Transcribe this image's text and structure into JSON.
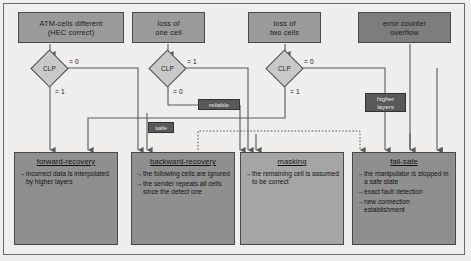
{
  "diagram": {
    "title_hidden": "",
    "colors": {
      "box_fill": "#9a9a9a",
      "box_fill_dark": "#7d7d7d",
      "box_fill_light": "#a5a5a5",
      "diamond_fill": "#c9c9c9",
      "tag_fill": "#595959",
      "line": "#5a5a5a",
      "background": "#efeeec"
    },
    "top_nodes": [
      {
        "id": "atm-cells-different",
        "lines": [
          "ATM-cells different",
          "(HEC correct)"
        ]
      },
      {
        "id": "loss-of-one-cell",
        "lines": [
          "loss of",
          "one cell"
        ]
      },
      {
        "id": "loss-of-two-cells",
        "lines": [
          "loss of",
          "two cells"
        ]
      },
      {
        "id": "error-counter-overflow",
        "lines": [
          "error counter",
          "overflow"
        ]
      }
    ],
    "decisions": [
      {
        "id": "clp-1",
        "label": "CLP",
        "right_label": "= 0",
        "down_label": "= 1"
      },
      {
        "id": "clp-2",
        "label": "CLP",
        "right_label": "= 1",
        "down_label": "= 0"
      },
      {
        "id": "clp-3",
        "label": "CLP",
        "right_label": "= 0",
        "down_label": "= 1"
      }
    ],
    "tags": [
      {
        "id": "reliable",
        "lines": [
          "reliable"
        ]
      },
      {
        "id": "safe",
        "lines": [
          "safe"
        ]
      },
      {
        "id": "higher-layers",
        "lines": [
          "higher",
          "layers"
        ]
      }
    ],
    "bottom_nodes": [
      {
        "id": "forward-recovery",
        "header": "forward-recovery",
        "items": [
          "incorrect data is interpolated by higher layers"
        ]
      },
      {
        "id": "backward-recovery",
        "header": "backward-recovery",
        "items": [
          "the following cells are ignored",
          "the sender repeats all cells since the defect one"
        ]
      },
      {
        "id": "masking",
        "header": "masking",
        "items": [
          "the remaining cell is assumed to be correct"
        ]
      },
      {
        "id": "fail-safe",
        "header": "fail-safe",
        "items": [
          "the manipulator is stopped in a safe state",
          "exact fault detection",
          "new connection establishment"
        ]
      }
    ]
  }
}
